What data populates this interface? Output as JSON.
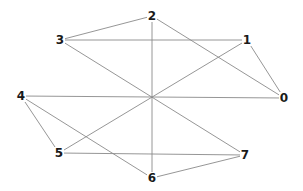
{
  "diagram": {
    "type": "graph",
    "title": "",
    "nodes": [
      {
        "id": "0",
        "label": "0",
        "x": 284,
        "y": 98
      },
      {
        "id": "1",
        "label": "1",
        "x": 247,
        "y": 40
      },
      {
        "id": "2",
        "label": "2",
        "x": 152,
        "y": 16
      },
      {
        "id": "3",
        "label": "3",
        "x": 60,
        "y": 40
      },
      {
        "id": "4",
        "label": "4",
        "x": 21,
        "y": 96
      },
      {
        "id": "5",
        "label": "5",
        "x": 59,
        "y": 153
      },
      {
        "id": "6",
        "label": "6",
        "x": 152,
        "y": 178
      },
      {
        "id": "7",
        "label": "7",
        "x": 245,
        "y": 155
      }
    ],
    "edges": [
      {
        "from": "2",
        "to": "6"
      },
      {
        "from": "3",
        "to": "1"
      },
      {
        "from": "3",
        "to": "2"
      },
      {
        "from": "2",
        "to": "0"
      },
      {
        "from": "1",
        "to": "0"
      },
      {
        "from": "1",
        "to": "5"
      },
      {
        "from": "4",
        "to": "0"
      },
      {
        "from": "4",
        "to": "5"
      },
      {
        "from": "4",
        "to": "6"
      },
      {
        "from": "3",
        "to": "7"
      },
      {
        "from": "5",
        "to": "7"
      },
      {
        "from": "6",
        "to": "7"
      }
    ],
    "colors": {
      "edge": "#8a8a8a",
      "label": "#1a1a1a",
      "background": "#ffffff"
    }
  }
}
